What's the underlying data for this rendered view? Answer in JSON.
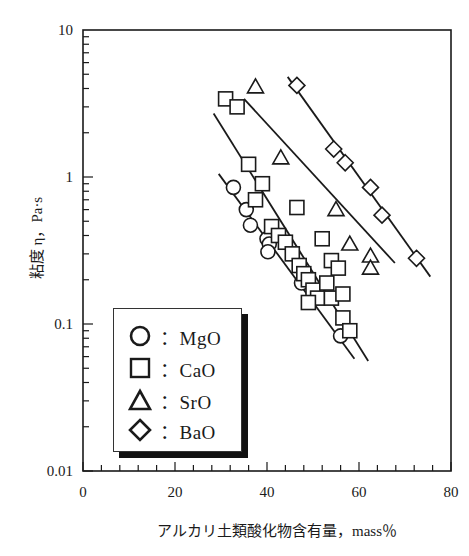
{
  "chart_data": {
    "type": "scatter",
    "title": "",
    "xlabel": "アルカリ土類酸化物含有量，mass％",
    "ylabel": "粘度 η，Pa·s",
    "xlim": [
      0,
      80
    ],
    "ylim": [
      0.01,
      10
    ],
    "yscale": "log",
    "x_ticks": [
      "0",
      "20",
      "40",
      "60",
      "80"
    ],
    "y_ticks": [
      "0.01",
      "0.1",
      "1",
      "10"
    ],
    "grid": false,
    "legend_position": "lower-left inside",
    "series": [
      {
        "name": "MgO",
        "marker": "circle",
        "points": [
          [
            32.7,
            0.85
          ],
          [
            35.5,
            0.6
          ],
          [
            36.4,
            0.47
          ],
          [
            40.0,
            0.38
          ],
          [
            40.5,
            0.35
          ],
          [
            40.2,
            0.31
          ],
          [
            47.5,
            0.19
          ],
          [
            56.0,
            0.083
          ]
        ],
        "fit_line": [
          [
            29.5,
            1.05
          ],
          [
            59.0,
            0.058
          ]
        ]
      },
      {
        "name": "CaO",
        "marker": "square",
        "points": [
          [
            31.0,
            3.4
          ],
          [
            33.5,
            3.0
          ],
          [
            36.0,
            1.22
          ],
          [
            39.0,
            0.9
          ],
          [
            37.5,
            0.7
          ],
          [
            41.0,
            0.46
          ],
          [
            42.5,
            0.4
          ],
          [
            44.0,
            0.36
          ],
          [
            45.5,
            0.3
          ],
          [
            47.0,
            0.25
          ],
          [
            48.0,
            0.22
          ],
          [
            49.0,
            0.2
          ],
          [
            50.0,
            0.17
          ],
          [
            51.0,
            0.15
          ],
          [
            49.0,
            0.14
          ],
          [
            53.0,
            0.19
          ],
          [
            54.0,
            0.27
          ],
          [
            55.5,
            0.24
          ],
          [
            52.0,
            0.38
          ],
          [
            46.5,
            0.62
          ],
          [
            54.0,
            0.15
          ],
          [
            56.5,
            0.16
          ],
          [
            56.5,
            0.11
          ],
          [
            58.0,
            0.09
          ]
        ],
        "fit_line": [
          [
            28.4,
            2.7
          ],
          [
            62.0,
            0.056
          ]
        ]
      },
      {
        "name": "SrO",
        "marker": "triangle",
        "points": [
          [
            37.5,
            4.1
          ],
          [
            43.0,
            1.35
          ],
          [
            55.0,
            0.6
          ],
          [
            58.0,
            0.35
          ],
          [
            62.5,
            0.29
          ],
          [
            62.5,
            0.24
          ]
        ],
        "fit_line": [
          [
            35.0,
            3.4
          ],
          [
            67.8,
            0.26
          ]
        ]
      },
      {
        "name": "BaO",
        "marker": "diamond",
        "points": [
          [
            46.5,
            4.2
          ],
          [
            54.5,
            1.55
          ],
          [
            57.0,
            1.25
          ],
          [
            62.5,
            0.85
          ],
          [
            65.0,
            0.55
          ],
          [
            72.5,
            0.28
          ]
        ],
        "fit_line": [
          [
            44.5,
            4.8
          ],
          [
            75.5,
            0.21
          ]
        ]
      }
    ]
  },
  "legend": {
    "items": [
      {
        "symbol": "circle",
        "label": "：MgO"
      },
      {
        "symbol": "square",
        "label": "：CaO"
      },
      {
        "symbol": "triangle",
        "label": "：SrO"
      },
      {
        "symbol": "diamond",
        "label": "：BaO"
      }
    ]
  },
  "colors": {
    "ink": "#1a1a1a",
    "background": "#ffffff"
  }
}
